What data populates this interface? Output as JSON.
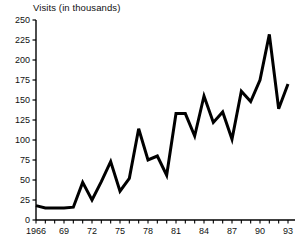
{
  "chart_data": {
    "type": "line",
    "title": "Visits (in thousands)",
    "xlabel": "",
    "ylabel": "Visits (in thousands)",
    "ylim": [
      0,
      250
    ],
    "ytick_values": [
      0,
      25,
      50,
      75,
      100,
      125,
      150,
      175,
      200,
      225,
      250
    ],
    "ytick_labels": [
      "0",
      "25",
      "50",
      "75",
      "100",
      "125",
      "150",
      "175",
      "200",
      "225",
      "250"
    ],
    "xlim": [
      1966,
      1993
    ],
    "xtick_values": [
      1966,
      1969,
      1972,
      1975,
      1978,
      1981,
      1984,
      1987,
      1990,
      1993
    ],
    "xtick_labels": [
      "1966",
      "69",
      "72",
      "75",
      "78",
      "81",
      "84",
      "87",
      "90",
      "93"
    ],
    "minor_xticks_every": 1,
    "grid": false,
    "legend": "none",
    "line_color": "#000000",
    "line_width": 3,
    "categories": [
      1966,
      1967,
      1968,
      1969,
      1970,
      1971,
      1972,
      1973,
      1974,
      1975,
      1976,
      1977,
      1978,
      1979,
      1980,
      1981,
      1982,
      1983,
      1984,
      1985,
      1986,
      1987,
      1988,
      1989,
      1990,
      1991,
      1992,
      1993
    ],
    "values": [
      18,
      15,
      15,
      15,
      16,
      47,
      25,
      48,
      73,
      36,
      52,
      114,
      75,
      80,
      56,
      133,
      133,
      105,
      155,
      122,
      135,
      101,
      161,
      148,
      175,
      232,
      139,
      170
    ],
    "series": [
      {
        "name": "Visits",
        "values": [
          18,
          15,
          15,
          15,
          16,
          47,
          25,
          48,
          73,
          36,
          52,
          114,
          75,
          80,
          56,
          133,
          133,
          105,
          155,
          122,
          135,
          101,
          161,
          148,
          175,
          232,
          139,
          170
        ]
      }
    ]
  },
  "plot_geometry": {
    "x0": 36,
    "x1": 288,
    "y0": 220,
    "y1": 20
  }
}
